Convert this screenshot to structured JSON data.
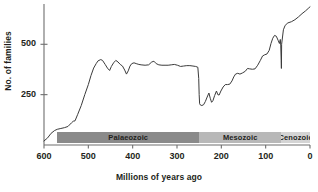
{
  "chart_data": {
    "type": "line",
    "title": "",
    "xlabel": "Millions of years ago",
    "ylabel": "No. of families",
    "xlim": [
      600,
      0
    ],
    "ylim": [
      0,
      700
    ],
    "x_reversed": true,
    "grid": false,
    "legend": "none",
    "xticks": [
      600,
      500,
      400,
      300,
      200,
      100,
      0
    ],
    "yticks": [
      250,
      500
    ],
    "line_color": "#3b3b3b",
    "series": [
      {
        "name": "No. of families",
        "points": [
          [
            600,
            20
          ],
          [
            592,
            35
          ],
          [
            584,
            58
          ],
          [
            576,
            72
          ],
          [
            570,
            78
          ],
          [
            562,
            82
          ],
          [
            554,
            86
          ],
          [
            546,
            92
          ],
          [
            538,
            110
          ],
          [
            534,
            118
          ],
          [
            530,
            120
          ],
          [
            524,
            152
          ],
          [
            516,
            196
          ],
          [
            508,
            250
          ],
          [
            500,
            300
          ],
          [
            494,
            345
          ],
          [
            488,
            382
          ],
          [
            482,
            405
          ],
          [
            478,
            418
          ],
          [
            472,
            424
          ],
          [
            468,
            420
          ],
          [
            462,
            400
          ],
          [
            457,
            382
          ],
          [
            452,
            370
          ],
          [
            448,
            390
          ],
          [
            443,
            408
          ],
          [
            438,
            420
          ],
          [
            433,
            412
          ],
          [
            428,
            400
          ],
          [
            423,
            392
          ],
          [
            418,
            372
          ],
          [
            414,
            352
          ],
          [
            410,
            368
          ],
          [
            406,
            392
          ],
          [
            402,
            404
          ],
          [
            397,
            408
          ],
          [
            392,
            404
          ],
          [
            386,
            400
          ],
          [
            381,
            398
          ],
          [
            372,
            396
          ],
          [
            364,
            398
          ],
          [
            357,
            412
          ],
          [
            352,
            416
          ],
          [
            347,
            404
          ],
          [
            341,
            398
          ],
          [
            334,
            396
          ],
          [
            327,
            396
          ],
          [
            320,
            396
          ],
          [
            313,
            398
          ],
          [
            306,
            400
          ],
          [
            299,
            396
          ],
          [
            292,
            390
          ],
          [
            285,
            392
          ],
          [
            278,
            394
          ],
          [
            271,
            394
          ],
          [
            264,
            392
          ],
          [
            258,
            390
          ],
          [
            253,
            386
          ],
          [
            251,
            330
          ],
          [
            250,
            250
          ],
          [
            249,
            205
          ],
          [
            247,
            198
          ],
          [
            244,
            196
          ],
          [
            240,
            200
          ],
          [
            236,
            216
          ],
          [
            232,
            238
          ],
          [
            228,
            258
          ],
          [
            225,
            232
          ],
          [
            222,
            212
          ],
          [
            219,
            220
          ],
          [
            215,
            246
          ],
          [
            211,
            268
          ],
          [
            208,
            250
          ],
          [
            205,
            248
          ],
          [
            201,
            268
          ],
          [
            196,
            288
          ],
          [
            191,
            300
          ],
          [
            186,
            300
          ],
          [
            181,
            302
          ],
          [
            176,
            318
          ],
          [
            172,
            338
          ],
          [
            168,
            352
          ],
          [
            163,
            356
          ],
          [
            158,
            352
          ],
          [
            152,
            358
          ],
          [
            146,
            366
          ],
          [
            141,
            380
          ],
          [
            136,
            378
          ],
          [
            130,
            376
          ],
          [
            124,
            378
          ],
          [
            118,
            396
          ],
          [
            112,
            420
          ],
          [
            107,
            442
          ],
          [
            102,
            448
          ],
          [
            97,
            452
          ],
          [
            92,
            470
          ],
          [
            88,
            504
          ],
          [
            84,
            530
          ],
          [
            80,
            544
          ],
          [
            76,
            540
          ],
          [
            72,
            520
          ],
          [
            69,
            504
          ],
          [
            67,
            524
          ],
          [
            66,
            496
          ],
          [
            65,
            420
          ],
          [
            64.5,
            380
          ],
          [
            64,
            500
          ],
          [
            60,
            572
          ],
          [
            56,
            594
          ],
          [
            50,
            606
          ],
          [
            42,
            612
          ],
          [
            34,
            622
          ],
          [
            26,
            636
          ],
          [
            18,
            652
          ],
          [
            10,
            666
          ],
          [
            4,
            678
          ],
          [
            0,
            686
          ]
        ]
      }
    ],
    "eras": [
      {
        "name": "Palaeozoic",
        "start": 570,
        "end": 250,
        "color": "#8a8a8a"
      },
      {
        "name": "Mesozoic",
        "start": 250,
        "end": 65,
        "color": "#b8b8b8"
      },
      {
        "name": "Cenozoic",
        "start": 65,
        "end": 0,
        "color": "#d4d4d4"
      }
    ]
  }
}
